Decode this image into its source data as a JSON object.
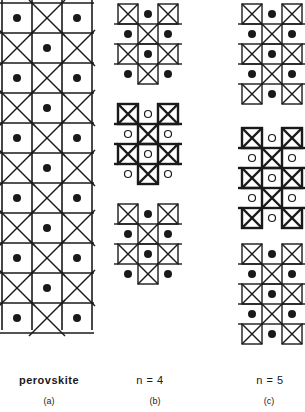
{
  "figure": {
    "panels": [
      {
        "id": "a",
        "name": "perovskite",
        "label": "(a)",
        "blocks": [
          {
            "x": 0,
            "y": 0,
            "cols": 3,
            "rows": 11,
            "cell": 30,
            "pattern": "perovskite",
            "atom": "filled"
          }
        ]
      },
      {
        "id": "b",
        "name": "n = 4",
        "label": "(b)",
        "blocks": [
          {
            "x": 118,
            "y": 4,
            "cols": 3,
            "rows": 4,
            "cell": 20,
            "atom": "filled"
          },
          {
            "x": 118,
            "y": 104,
            "cols": 3,
            "rows": 4,
            "cell": 20,
            "atom": "open"
          },
          {
            "x": 118,
            "y": 204,
            "cols": 3,
            "rows": 4,
            "cell": 20,
            "atom": "filled"
          }
        ]
      },
      {
        "id": "c",
        "name": "n = 5",
        "label": "(c)",
        "blocks": [
          {
            "x": 242,
            "y": 4,
            "cols": 3,
            "rows": 5,
            "cell": 20,
            "atom": "filled"
          },
          {
            "x": 242,
            "y": 128,
            "cols": 3,
            "rows": 5,
            "cell": 20,
            "atom": "open"
          },
          {
            "x": 242,
            "y": 244,
            "cols": 3,
            "rows": 5,
            "cell": 20,
            "atom": "filled"
          }
        ]
      }
    ],
    "colors": {
      "line": "#1a1a1a",
      "background": "#ffffff"
    }
  },
  "labels": {
    "a_name": "perovskite",
    "b_name": "n = 4",
    "c_name": "n = 5",
    "a_sub": "(a)",
    "b_sub": "(b)",
    "c_sub": "(c)"
  }
}
